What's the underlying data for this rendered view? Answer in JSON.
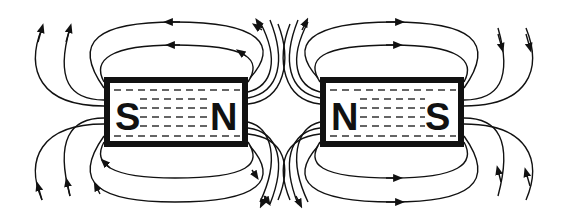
{
  "diagram": {
    "colors": {
      "ink": "#111111",
      "background": "#ffffff"
    },
    "magnets": [
      {
        "id": "left",
        "left_pole": "S",
        "right_pole": "N",
        "x": 104,
        "y": 77,
        "w": 144,
        "h": 70
      },
      {
        "id": "right",
        "left_pole": "N",
        "right_pole": "S",
        "x": 320,
        "y": 77,
        "w": 144,
        "h": 70
      }
    ],
    "field_line_direction": "from N to S outside the magnet; lines repel between facing N poles"
  }
}
